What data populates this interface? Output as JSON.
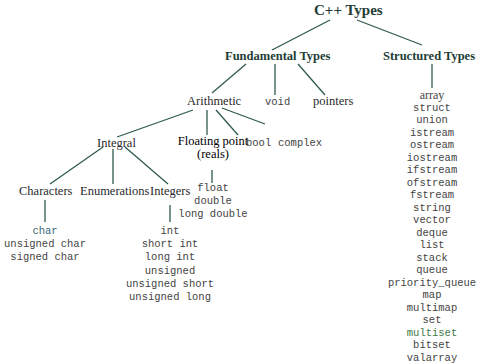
{
  "title": "C++ Types",
  "nodes": {
    "fundamental": "Fundamental Types",
    "structured": "Structured Types",
    "arithmetic": "Arithmetic",
    "void": "void",
    "pointers": "pointers",
    "integral": "Integral",
    "floating_line1": "Floating point",
    "floating_line2": "(reals)",
    "bool": "bool",
    "complex": "complex",
    "characters": "Characters",
    "enumerations": "Enumerations",
    "integers": "Integers"
  },
  "lists": {
    "floating": [
      "float",
      "double",
      "long double"
    ],
    "characters": [
      "char",
      "unsigned char",
      "signed char"
    ],
    "integers": [
      "int",
      "short int",
      "long int",
      "unsigned",
      "unsigned short",
      "unsigned long"
    ],
    "structured": [
      "array",
      "struct",
      "union",
      "istream",
      "ostream",
      "iostream",
      "ifstream",
      "ofstream",
      "fstream",
      "string",
      "vector",
      "deque",
      "list",
      "stack",
      "queue",
      "priority_queue",
      "map",
      "multimap",
      "set",
      "multiset",
      "bitset",
      "valarray"
    ]
  },
  "colors": {
    "line": "#2f5a4e",
    "heading": "#1e3d35"
  }
}
